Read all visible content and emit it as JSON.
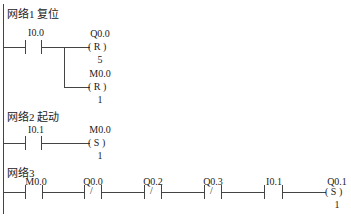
{
  "networks": [
    {
      "title": "网络1 复位",
      "contacts": [
        {
          "address": "I0.0",
          "type": "NO"
        }
      ],
      "coils": [
        {
          "address": "Q0.0",
          "op": "R",
          "n": "5"
        },
        {
          "address": "M0.0",
          "op": "R",
          "n": "1"
        }
      ]
    },
    {
      "title": "网络2 起动",
      "contacts": [
        {
          "address": "I0.1",
          "type": "NO"
        }
      ],
      "coils": [
        {
          "address": "M0.0",
          "op": "S",
          "n": "1"
        }
      ]
    },
    {
      "title": "网络3",
      "contacts": [
        {
          "address": "M0.0",
          "type": "NO"
        },
        {
          "address": "Q0.0",
          "type": "NC"
        },
        {
          "address": "Q0.2",
          "type": "NC"
        },
        {
          "address": "Q0.3",
          "type": "NC"
        },
        {
          "address": "I0.1",
          "type": "NO"
        }
      ],
      "coils": [
        {
          "address": "Q0.1",
          "op": "S",
          "n": "1"
        }
      ]
    }
  ],
  "glyphs": {
    "nc_slash": "/",
    "coil_left": "(",
    "coil_right": ")"
  }
}
